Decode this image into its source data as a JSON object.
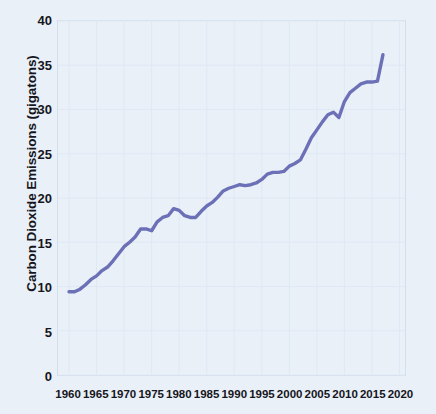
{
  "chart_data": {
    "type": "line",
    "title": "",
    "xlabel": "",
    "ylabel": "Carbon Dioxide Emissions (gigatons)",
    "xlim": [
      1958,
      2021
    ],
    "ylim": [
      0,
      40
    ],
    "xticks": [
      1960,
      1965,
      1970,
      1975,
      1980,
      1985,
      1990,
      1995,
      2000,
      2005,
      2010,
      2015,
      2020
    ],
    "xtick_labels": [
      "1960",
      "1965",
      "1970",
      "1975",
      "1980",
      "1985",
      "1990",
      "1995",
      "2000",
      "2005",
      "2010",
      "2015",
      "2020"
    ],
    "yticks": [
      0,
      5,
      10,
      15,
      20,
      25,
      30,
      35,
      40
    ],
    "ytick_labels": [
      "0",
      "5",
      "10",
      "15",
      "20",
      "25",
      "30",
      "35",
      "40"
    ],
    "grid": true,
    "legend": false,
    "line_color": "#6c70b6",
    "background_color": "#e9f0f8",
    "series": [
      {
        "name": "Global CO2 emissions",
        "x": [
          1960,
          1961,
          1962,
          1963,
          1964,
          1965,
          1966,
          1967,
          1968,
          1969,
          1970,
          1971,
          1972,
          1973,
          1974,
          1975,
          1976,
          1977,
          1978,
          1979,
          1980,
          1981,
          1982,
          1983,
          1984,
          1985,
          1986,
          1987,
          1988,
          1989,
          1990,
          1991,
          1992,
          1993,
          1994,
          1995,
          1996,
          1997,
          1998,
          1999,
          2000,
          2001,
          2002,
          2003,
          2004,
          2005,
          2006,
          2007,
          2008,
          2009,
          2010,
          2011,
          2012,
          2013,
          2014,
          2015,
          2016,
          2017
        ],
        "values": [
          9.4,
          9.4,
          9.7,
          10.2,
          10.8,
          11.2,
          11.8,
          12.2,
          12.9,
          13.7,
          14.5,
          15.0,
          15.6,
          16.5,
          16.5,
          16.3,
          17.3,
          17.8,
          18.0,
          18.8,
          18.6,
          18.0,
          17.8,
          17.8,
          18.5,
          19.1,
          19.5,
          20.1,
          20.8,
          21.1,
          21.3,
          21.5,
          21.4,
          21.5,
          21.7,
          22.1,
          22.7,
          22.9,
          22.9,
          23.0,
          23.6,
          23.9,
          24.3,
          25.5,
          26.8,
          27.7,
          28.6,
          29.4,
          29.7,
          29.1,
          30.9,
          31.9,
          32.4,
          32.9,
          33.1,
          33.1,
          33.2,
          36.2
        ]
      }
    ]
  }
}
